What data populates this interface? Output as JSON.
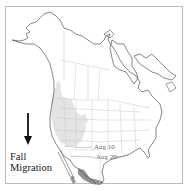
{
  "legend": {
    "line1": "Fall",
    "line2": "Migration",
    "arrow": "arrow-down-icon"
  },
  "isochrones": [
    {
      "label": "Aug 10"
    },
    {
      "label": "Aug 20"
    }
  ],
  "colors": {
    "coast": "#555555",
    "borders": "#c8c8c8",
    "range_light": "#e2e2e2",
    "range_dark": "#8f8f8f",
    "frame": "#bdbdbd",
    "arrow": "#111111"
  }
}
